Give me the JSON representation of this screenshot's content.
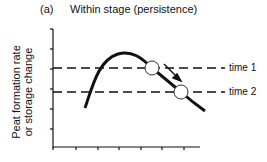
{
  "figure": {
    "panel_label": "(a)",
    "title": "Within stage (persistence)",
    "ylabel_line1": "Peat formation rate",
    "ylabel_line2": "or storage change",
    "lines": [
      {
        "label": "time 1",
        "y": 68
      },
      {
        "label": "time 2",
        "y": 92
      }
    ]
  }
}
